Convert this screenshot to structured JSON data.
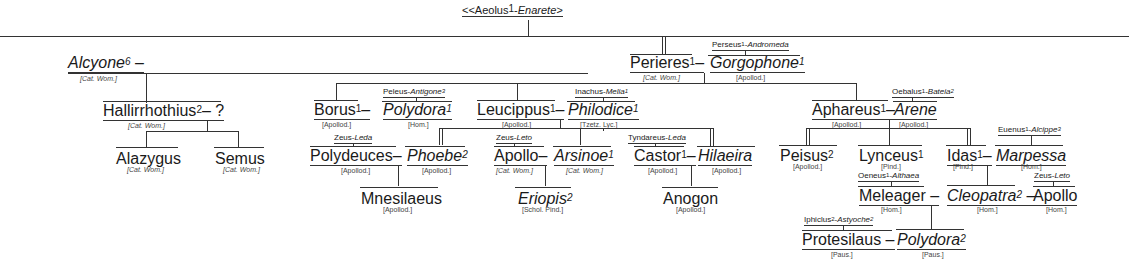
{
  "root": {
    "text": "<<Aeolus",
    "sup": "1",
    "sep": "-",
    "wife": "Enarete",
    "tail": ">"
  },
  "nodes": {
    "alcyone": {
      "name": "Alcyone",
      "sup": "6",
      "dash": " –",
      "src": "[Cat. Wom.]"
    },
    "hallirrhothius": {
      "name": "Hallirrhothius",
      "sup": "2",
      "dash": "– ?",
      "src": "[Cat. Wom.]"
    },
    "alazygus": {
      "name": "Alazygus",
      "src": "[Cat. Wom.]"
    },
    "semus": {
      "name": "Semus",
      "src": "[Cat. Wom.]"
    },
    "perieres": {
      "name": "Perieres",
      "sup": "1",
      "dash": "–",
      "src": "[Cat. Wom.]"
    },
    "gorgophone": {
      "name": "Gorgophone",
      "sup": "1",
      "src": "[Apollod.]",
      "parents": {
        "father": "Perseus",
        "fsup": "1",
        "mother": "Andromeda"
      }
    },
    "borus": {
      "name": "Borus",
      "sup": "1",
      "dash": "–",
      "src": "[Apollod.]"
    },
    "polydora1": {
      "name": "Polydora",
      "sup": "1",
      "src": "[Hom.]",
      "parents": {
        "father": "Peleus",
        "mother": "Antigone",
        "msup": "3"
      }
    },
    "leucippus": {
      "name": "Leucippus",
      "sup": "1",
      "dash": "–",
      "src": "[Apollod.]"
    },
    "philodice": {
      "name": "Philodice",
      "sup": "1",
      "src": "[Tzetz. Lyc.]",
      "parents": {
        "father": "Inachus",
        "mother": "Melia",
        "msup": "1"
      }
    },
    "aphareus": {
      "name": "Aphareus",
      "sup": "1",
      "dash": "–",
      "src": "[Apollod.]"
    },
    "arene": {
      "name": "Arene",
      "src": "[Apollod.]",
      "parents": {
        "father": "Oebalus",
        "fsup": "1",
        "mother": "Bateia",
        "msup": "2"
      }
    },
    "polydeuces": {
      "name": "Polydeuces",
      "dash": "–",
      "src": "[Apollod.]",
      "parents": {
        "father": "Zeus",
        "mother": "Leda"
      }
    },
    "phoebe": {
      "name": "Phoebe",
      "sup": "2",
      "src": "[Apollod.]"
    },
    "apollo1": {
      "name": "Apollo",
      "dash": "–",
      "src": "[Cat. Wom.]",
      "parents": {
        "father": "Zeus",
        "mother": "Leto"
      }
    },
    "arsinoe": {
      "name": "Arsinoe",
      "sup": "1",
      "src": "[Cat. Wom.]"
    },
    "castor": {
      "name": "Castor",
      "sup": "1",
      "dash": "–",
      "src": "[Apollod.]",
      "parents": {
        "father": "Tyndareus",
        "mother": "Leda"
      }
    },
    "hilaeira": {
      "name": "Hilaeira",
      "src": "[Apollod.]"
    },
    "mnesilaeus": {
      "name": "Mnesilaeus",
      "src": "[Apollod.]"
    },
    "eriopis": {
      "name": "Eriopis",
      "sup": "2",
      "src": "[Schol. Pind.]"
    },
    "anogon": {
      "name": "Anogon",
      "src": "[Apollod.]"
    },
    "peisus": {
      "name": "Peisus",
      "sup": "2",
      "src": "[Apollod.]"
    },
    "lynceus": {
      "name": "Lynceus",
      "sup": "1",
      "src": "[Pind.]"
    },
    "idas": {
      "name": "Idas",
      "sup": "1",
      "dash": "–",
      "src": "[Pind.]"
    },
    "marpessa": {
      "name": "Marpessa",
      "src": "[Hom.]",
      "parents": {
        "father": "Euenus",
        "fsup": "1",
        "mother": "Alcippe",
        "msup": "3"
      }
    },
    "meleager": {
      "name": "Meleager",
      "dash": " –",
      "src": "[Hom.]",
      "parents": {
        "father": "Oeneus",
        "fsup": "1",
        "mother": "Althaea"
      }
    },
    "cleopatra": {
      "name": "Cleopatra",
      "sup": "2",
      "dash": " –",
      "src": "[Hom.]"
    },
    "apollo2": {
      "name": "Apollo",
      "src": "[Hom.]",
      "parents": {
        "father": "Zeus",
        "mother": "Leto"
      }
    },
    "protesilaus": {
      "name": "Protesilaus",
      "dash": " –",
      "src": "[Paus.]",
      "parents": {
        "father": "Iphiclus",
        "fsup": "2",
        "mother": "Astyoche",
        "msup": "2"
      }
    },
    "polydora2": {
      "name": "Polydora",
      "sup": "2",
      "src": "[Paus.]"
    }
  }
}
